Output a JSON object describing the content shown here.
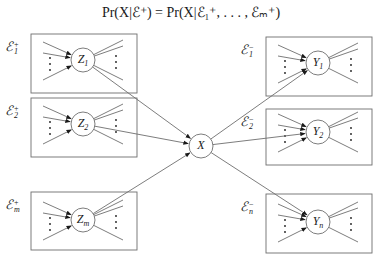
{
  "formula": {
    "text": "Pr(X|ℰ⁺) = Pr(X|ℰ₁⁺, . . . , ℰₘ⁺)"
  },
  "center_node": {
    "label": "X",
    "cx": 201,
    "cy": 146,
    "r": 12
  },
  "left_groups": [
    {
      "evidence_label": "ℰ",
      "evidence_sup": "+",
      "evidence_sub": "1",
      "node_label": "Z",
      "node_sub": "1",
      "box": [
        31,
        34,
        106,
        59
      ],
      "cx": 83,
      "cy": 60
    },
    {
      "evidence_label": "ℰ",
      "evidence_sup": "+",
      "evidence_sub": "2",
      "node_label": "Z",
      "node_sub": "2",
      "box": [
        31,
        98,
        106,
        59
      ],
      "cx": 83,
      "cy": 124
    },
    {
      "evidence_label": "ℰ",
      "evidence_sup": "+",
      "evidence_sub": "m",
      "node_label": "Z",
      "node_sub": "m",
      "box": [
        31,
        192,
        106,
        58
      ],
      "cx": 83,
      "cy": 220
    }
  ],
  "right_groups": [
    {
      "evidence_label": "ℰ",
      "evidence_sup": "−",
      "evidence_sub": "1",
      "node_label": "Y",
      "node_sub": "1",
      "box": [
        266,
        37,
        106,
        59
      ],
      "cx": 318,
      "cy": 63
    },
    {
      "evidence_label": "ℰ",
      "evidence_sup": "−",
      "evidence_sub": "2",
      "node_label": "Y",
      "node_sub": "2",
      "box": [
        266,
        109,
        106,
        56
      ],
      "cx": 318,
      "cy": 132
    },
    {
      "evidence_label": "ℰ",
      "evidence_sup": "−",
      "evidence_sub": "n",
      "node_label": "Y",
      "node_sub": "n",
      "box": [
        266,
        194,
        106,
        59
      ],
      "cx": 318,
      "cy": 222
    }
  ],
  "colors": {
    "stroke": "#6e6e6e",
    "text": "#1a1a1a",
    "background": "#ffffff"
  }
}
